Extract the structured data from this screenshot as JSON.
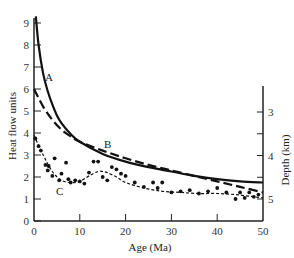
{
  "chart_data": {
    "type": "line",
    "title": "",
    "xlabel": "Age (Ma)",
    "ylabel": "Heat flow units",
    "y2label": "Depth (km)",
    "xlim": [
      0,
      50
    ],
    "ylim": [
      0,
      9.5
    ],
    "y2lim": [
      2.5,
      5.5
    ],
    "y2_inverted": true,
    "grid": false,
    "legend": "none (inline curve labels A, B, C)",
    "x_ticks": [
      0,
      10,
      20,
      30,
      40,
      50
    ],
    "y_ticks": [
      0,
      1,
      2,
      3,
      4,
      5,
      6,
      7,
      8,
      9
    ],
    "y2_ticks": [
      3,
      4,
      5
    ],
    "series": [
      {
        "name": "A",
        "style": "solid",
        "x": [
          0.4,
          1,
          2,
          3,
          4,
          5,
          6,
          8,
          10,
          15,
          20,
          25,
          30,
          35,
          40,
          45,
          50
        ],
        "y": [
          9.3,
          8.0,
          6.7,
          5.9,
          5.3,
          4.8,
          4.45,
          3.95,
          3.6,
          3.05,
          2.7,
          2.45,
          2.25,
          2.05,
          1.9,
          1.8,
          1.75
        ]
      },
      {
        "name": "B",
        "style": "dashed",
        "x": [
          0,
          2,
          4,
          6,
          8,
          10,
          15,
          20,
          25,
          30,
          35,
          40,
          45,
          50
        ],
        "y": [
          6.0,
          5.2,
          4.6,
          4.15,
          3.85,
          3.6,
          3.2,
          2.85,
          2.55,
          2.3,
          2.05,
          1.8,
          1.55,
          1.3
        ]
      },
      {
        "name": "C",
        "style": "dotted-dashed",
        "x": [
          0,
          2,
          4,
          6,
          8,
          10,
          12,
          14,
          15,
          16,
          18,
          20,
          24,
          28,
          32,
          36,
          40,
          44,
          48,
          50
        ],
        "y": [
          3.9,
          3.0,
          2.25,
          1.85,
          1.75,
          1.8,
          2.05,
          2.25,
          2.25,
          2.2,
          2.0,
          1.75,
          1.5,
          1.35,
          1.3,
          1.25,
          1.25,
          1.2,
          1.1,
          1.05
        ]
      }
    ],
    "scatter_points": {
      "name": "C observations",
      "x": [
        0.3,
        1,
        1.5,
        2.5,
        3,
        3.2,
        4,
        4.5,
        5.5,
        6,
        7,
        7.5,
        8,
        9,
        10,
        11,
        12,
        13,
        14,
        15,
        16,
        17,
        18,
        19,
        20,
        22,
        24,
        26,
        27,
        28,
        30,
        32,
        34,
        36,
        38,
        40,
        42,
        44,
        45,
        46,
        47,
        48,
        49
      ],
      "y": [
        3.75,
        3.4,
        3.2,
        2.55,
        2.3,
        2.5,
        2.05,
        2.85,
        1.85,
        2.15,
        2.65,
        1.9,
        1.75,
        1.85,
        1.8,
        1.7,
        2.2,
        2.7,
        2.7,
        2.0,
        1.85,
        2.45,
        2.35,
        2.15,
        2.05,
        1.75,
        1.55,
        1.75,
        1.5,
        1.75,
        1.3,
        1.35,
        1.4,
        1.25,
        1.35,
        1.5,
        1.3,
        1.0,
        1.3,
        1.05,
        1.3,
        1.1,
        1.2
      ]
    },
    "annotations": [
      {
        "text": "A",
        "x": 2.2,
        "y": 6.5
      },
      {
        "text": "B",
        "x": 15.5,
        "y": 3.6
      },
      {
        "text": "C",
        "x": 5,
        "y": 1.4
      }
    ]
  },
  "labels": {
    "ylabel": "Heat flow units",
    "y2label": "Depth (km)",
    "xlabel": "Age (Ma)",
    "curve_a": "A",
    "curve_b": "B",
    "curve_c": "C"
  }
}
